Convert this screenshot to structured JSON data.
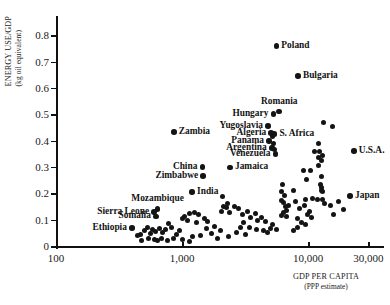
{
  "chart_data": {
    "type": "scatter",
    "title": "",
    "xlabel": "GDP PER CAPITA",
    "xlabel_sub": "(PPP estimate)",
    "ylabel": "ENERGY USE/GDP",
    "ylabel_sub": "(kg oil equivalent)",
    "xscale": "log",
    "xlim": [
      100,
      40000
    ],
    "ylim": [
      0,
      0.85
    ],
    "grid": false,
    "legend": null,
    "xticks": [
      {
        "value": 100,
        "label": "100"
      },
      {
        "value": 1000,
        "label": "1,000"
      },
      {
        "value": 10000,
        "label": "10,000"
      },
      {
        "value": 30000,
        "label": "30,000"
      }
    ],
    "yticks": [
      {
        "value": 0,
        "label": "0"
      },
      {
        "value": 0.1,
        "label": "0.1"
      },
      {
        "value": 0.2,
        "label": "0.2"
      },
      {
        "value": 0.3,
        "label": "0.3"
      },
      {
        "value": 0.4,
        "label": "0.4"
      },
      {
        "value": 0.5,
        "label": "0.5"
      },
      {
        "value": 0.6,
        "label": "0.6"
      },
      {
        "value": 0.7,
        "label": "0.7"
      },
      {
        "value": 0.8,
        "label": "0.8"
      }
    ],
    "labeled_points": [
      {
        "name": "Poland",
        "x": 5600,
        "y": 0.76,
        "label_side": "right"
      },
      {
        "name": "Bulgaria",
        "x": 8300,
        "y": 0.645,
        "label_side": "right"
      },
      {
        "name": "Romania",
        "x": 5900,
        "y": 0.51,
        "label_side": "above"
      },
      {
        "name": "Hungary",
        "x": 5300,
        "y": 0.5,
        "label_side": "left"
      },
      {
        "name": "Yugoslavia",
        "x": 4800,
        "y": 0.455,
        "label_side": "left"
      },
      {
        "name": "Zambia",
        "x": 860,
        "y": 0.433,
        "label_side": "right"
      },
      {
        "name": "Algeria",
        "x": 5100,
        "y": 0.428,
        "label_side": "left"
      },
      {
        "name": "S. Africa",
        "x": 5400,
        "y": 0.425,
        "label_side": "right"
      },
      {
        "name": "Panama",
        "x": 4900,
        "y": 0.398,
        "label_side": "left"
      },
      {
        "name": "Argentina",
        "x": 5150,
        "y": 0.372,
        "label_side": "left"
      },
      {
        "name": "Venezuela",
        "x": 5500,
        "y": 0.35,
        "label_side": "left"
      },
      {
        "name": "U.S.A.",
        "x": 23000,
        "y": 0.36,
        "label_side": "right"
      },
      {
        "name": "China",
        "x": 1450,
        "y": 0.3,
        "label_side": "left"
      },
      {
        "name": "Jamaica",
        "x": 2400,
        "y": 0.298,
        "label_side": "right"
      },
      {
        "name": "Zimbabwe",
        "x": 1470,
        "y": 0.265,
        "label_side": "left"
      },
      {
        "name": "India",
        "x": 1200,
        "y": 0.205,
        "label_side": "right"
      },
      {
        "name": "Japan",
        "x": 21500,
        "y": 0.19,
        "label_side": "right"
      },
      {
        "name": "Mozambique",
        "x": 640,
        "y": 0.14,
        "label_side": "above"
      },
      {
        "name": "Sierra Leone",
        "x": 600,
        "y": 0.128,
        "label_side": "left"
      },
      {
        "name": "Somalia",
        "x": 620,
        "y": 0.112,
        "label_side": "left"
      },
      {
        "name": "Ethiopia",
        "x": 400,
        "y": 0.068,
        "label_side": "left"
      }
    ],
    "unlabeled_points": [
      {
        "x": 13200,
        "y": 0.468
      },
      {
        "x": 15500,
        "y": 0.455
      },
      {
        "x": 5250,
        "y": 0.415
      },
      {
        "x": 5350,
        "y": 0.388
      },
      {
        "x": 5450,
        "y": 0.368
      },
      {
        "x": 12200,
        "y": 0.388
      },
      {
        "x": 11200,
        "y": 0.36
      },
      {
        "x": 12400,
        "y": 0.357
      },
      {
        "x": 12900,
        "y": 0.345
      },
      {
        "x": 12000,
        "y": 0.335
      },
      {
        "x": 12700,
        "y": 0.325
      },
      {
        "x": 12200,
        "y": 0.305
      },
      {
        "x": 9200,
        "y": 0.288
      },
      {
        "x": 10400,
        "y": 0.285
      },
      {
        "x": 12800,
        "y": 0.262
      },
      {
        "x": 9700,
        "y": 0.252
      },
      {
        "x": 12600,
        "y": 0.232
      },
      {
        "x": 12800,
        "y": 0.222
      },
      {
        "x": 12700,
        "y": 0.212
      },
      {
        "x": 13100,
        "y": 0.208
      },
      {
        "x": 6300,
        "y": 0.235
      },
      {
        "x": 6100,
        "y": 0.205
      },
      {
        "x": 7600,
        "y": 0.21
      },
      {
        "x": 6500,
        "y": 0.19
      },
      {
        "x": 6200,
        "y": 0.172
      },
      {
        "x": 6400,
        "y": 0.165
      },
      {
        "x": 7900,
        "y": 0.168
      },
      {
        "x": 6600,
        "y": 0.148
      },
      {
        "x": 6350,
        "y": 0.128
      },
      {
        "x": 6700,
        "y": 0.133
      },
      {
        "x": 6150,
        "y": 0.115
      },
      {
        "x": 6800,
        "y": 0.112
      },
      {
        "x": 7000,
        "y": 0.155
      },
      {
        "x": 9600,
        "y": 0.175
      },
      {
        "x": 10900,
        "y": 0.182
      },
      {
        "x": 11800,
        "y": 0.175
      },
      {
        "x": 12900,
        "y": 0.178
      },
      {
        "x": 13400,
        "y": 0.16
      },
      {
        "x": 9300,
        "y": 0.152
      },
      {
        "x": 8500,
        "y": 0.142
      },
      {
        "x": 10200,
        "y": 0.132
      },
      {
        "x": 9900,
        "y": 0.118
      },
      {
        "x": 10600,
        "y": 0.108
      },
      {
        "x": 8300,
        "y": 0.105
      },
      {
        "x": 8900,
        "y": 0.088
      },
      {
        "x": 9600,
        "y": 0.082
      },
      {
        "x": 8200,
        "y": 0.072
      },
      {
        "x": 7700,
        "y": 0.058
      },
      {
        "x": 2100,
        "y": 0.188
      },
      {
        "x": 2300,
        "y": 0.16
      },
      {
        "x": 2150,
        "y": 0.15
      },
      {
        "x": 2250,
        "y": 0.145
      },
      {
        "x": 2050,
        "y": 0.132
      },
      {
        "x": 2400,
        "y": 0.128
      },
      {
        "x": 2600,
        "y": 0.15
      },
      {
        "x": 2800,
        "y": 0.142
      },
      {
        "x": 3000,
        "y": 0.118
      },
      {
        "x": 3300,
        "y": 0.132
      },
      {
        "x": 3500,
        "y": 0.11
      },
      {
        "x": 3800,
        "y": 0.122
      },
      {
        "x": 4000,
        "y": 0.098
      },
      {
        "x": 4300,
        "y": 0.108
      },
      {
        "x": 4600,
        "y": 0.092
      },
      {
        "x": 3100,
        "y": 0.088
      },
      {
        "x": 2900,
        "y": 0.07
      },
      {
        "x": 3400,
        "y": 0.072
      },
      {
        "x": 3900,
        "y": 0.062
      },
      {
        "x": 4400,
        "y": 0.058
      },
      {
        "x": 2700,
        "y": 0.052
      },
      {
        "x": 3200,
        "y": 0.045
      },
      {
        "x": 2350,
        "y": 0.035
      },
      {
        "x": 2000,
        "y": 0.058
      },
      {
        "x": 1800,
        "y": 0.075
      },
      {
        "x": 1600,
        "y": 0.092
      },
      {
        "x": 1500,
        "y": 0.105
      },
      {
        "x": 1350,
        "y": 0.118
      },
      {
        "x": 1250,
        "y": 0.128
      },
      {
        "x": 1150,
        "y": 0.122
      },
      {
        "x": 1050,
        "y": 0.112
      },
      {
        "x": 1000,
        "y": 0.105
      },
      {
        "x": 1100,
        "y": 0.098
      },
      {
        "x": 1300,
        "y": 0.088
      },
      {
        "x": 1550,
        "y": 0.068
      },
      {
        "x": 1700,
        "y": 0.048
      },
      {
        "x": 1400,
        "y": 0.04
      },
      {
        "x": 1200,
        "y": 0.035
      },
      {
        "x": 950,
        "y": 0.06
      },
      {
        "x": 900,
        "y": 0.045
      },
      {
        "x": 820,
        "y": 0.07
      },
      {
        "x": 780,
        "y": 0.085
      },
      {
        "x": 740,
        "y": 0.062
      },
      {
        "x": 700,
        "y": 0.05
      },
      {
        "x": 660,
        "y": 0.068
      },
      {
        "x": 620,
        "y": 0.055
      },
      {
        "x": 580,
        "y": 0.062
      },
      {
        "x": 560,
        "y": 0.048
      },
      {
        "x": 530,
        "y": 0.07
      },
      {
        "x": 500,
        "y": 0.058
      },
      {
        "x": 470,
        "y": 0.042
      },
      {
        "x": 440,
        "y": 0.038
      },
      {
        "x": 850,
        "y": 0.03
      },
      {
        "x": 770,
        "y": 0.022
      },
      {
        "x": 690,
        "y": 0.028
      },
      {
        "x": 640,
        "y": 0.02
      },
      {
        "x": 600,
        "y": 0.025
      },
      {
        "x": 540,
        "y": 0.03
      },
      {
        "x": 480,
        "y": 0.022
      },
      {
        "x": 1000,
        "y": 0.025
      },
      {
        "x": 1150,
        "y": 0.018
      },
      {
        "x": 1900,
        "y": 0.028
      },
      {
        "x": 5200,
        "y": 0.082
      },
      {
        "x": 5000,
        "y": 0.068
      },
      {
        "x": 4800,
        "y": 0.052
      },
      {
        "x": 5600,
        "y": 0.062
      },
      {
        "x": 15000,
        "y": 0.152
      },
      {
        "x": 17500,
        "y": 0.168
      },
      {
        "x": 19000,
        "y": 0.14
      },
      {
        "x": 16000,
        "y": 0.118
      }
    ]
  }
}
